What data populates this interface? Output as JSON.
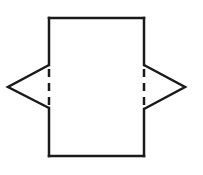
{
  "diagram": {
    "colors": {
      "stroke": "#1a1a1a",
      "background": "#ffffff"
    },
    "stroke_width": 2.5,
    "rectangle": {
      "x": 49,
      "y": 18,
      "width": 95,
      "height": 138
    },
    "left_flap": {
      "apex": [
        8,
        87
      ],
      "top": [
        49,
        65
      ],
      "bottom": [
        49,
        108
      ]
    },
    "right_flap": {
      "apex": [
        185,
        87
      ],
      "top": [
        144,
        65
      ],
      "bottom": [
        144,
        109
      ]
    },
    "fold_lines": [
      {
        "side": "left",
        "x": 49,
        "y1": 65,
        "y2": 108,
        "style": "dashed"
      },
      {
        "side": "right",
        "x": 144,
        "y1": 65,
        "y2": 109,
        "style": "dashed"
      }
    ]
  }
}
